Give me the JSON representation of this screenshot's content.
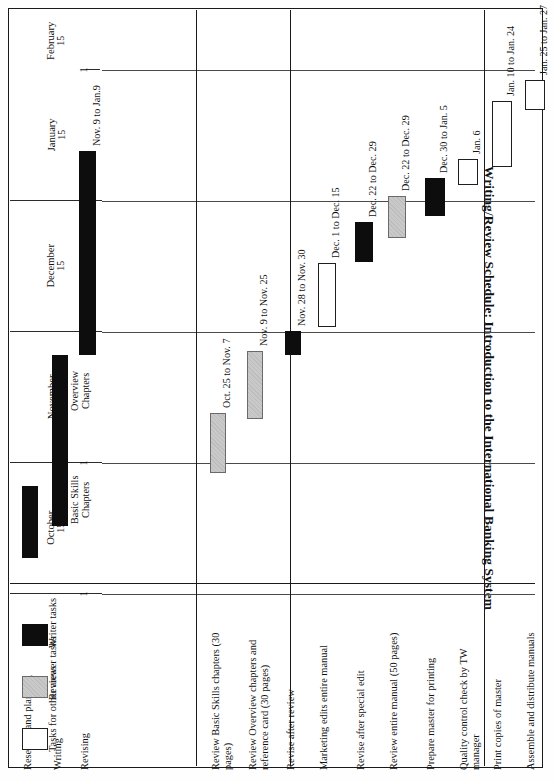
{
  "title": "Writing/Review Schedule: Introduction to the International Banking System",
  "legend": {
    "items": [
      {
        "key": "writer",
        "label": "Writer tasks",
        "color": "#0d0d0d"
      },
      {
        "key": "reviewer",
        "label": "Reviewer tasks",
        "color": "#c9c9c9"
      },
      {
        "key": "other",
        "label": "Tasks for other areas",
        "color": "#ffffff"
      }
    ]
  },
  "axis": {
    "orientation": "vertical-months",
    "months": [
      {
        "name": "October",
        "mid": "15",
        "start_tick": "1"
      },
      {
        "name": "November",
        "mid": "15",
        "start_tick": "1"
      },
      {
        "name": "December",
        "mid": "15",
        "start_tick": "1"
      },
      {
        "name": "January",
        "mid": "15",
        "start_tick": "1"
      },
      {
        "name": "February",
        "mid": "15",
        "start_tick": "1"
      }
    ]
  },
  "chart_data": {
    "type": "bar",
    "subtype": "gantt",
    "title": "Writing/Review Schedule: Introduction to the International Banking System",
    "xlabel": "",
    "ylabel": "",
    "grid": true,
    "legend_position": "bottom-left",
    "time_axis": {
      "labels": [
        "October 1",
        "October 15",
        "November 1",
        "November 15",
        "December 1",
        "December 15",
        "January 1",
        "January 15",
        "February 1",
        "February 15"
      ],
      "range": [
        "Oct 1",
        "Feb 28"
      ]
    },
    "categories": [
      "Research and planning",
      "Writing",
      "Revising",
      "Review Basic Skills chapters (30 pages)",
      "Review Overview chapters and reference card (30 pages)",
      "Revise after review",
      "Marketing edits entire manual",
      "Revise after special edit",
      "Review entire manual (50 pages)",
      "Prepare master for printing",
      "Quality control check by TW manager",
      "Print copies of master",
      "Assemble and distribute manuals"
    ],
    "groups": [
      {
        "name": "group-1",
        "tasks": [
          "Research and planning",
          "Writing",
          "Revising"
        ]
      },
      {
        "name": "group-2",
        "tasks": [
          "Review Basic Skills chapters (30 pages)",
          "Review Overview chapters and reference card (30 pages)",
          "Revise after review"
        ]
      },
      {
        "name": "group-3",
        "tasks": [
          "Marketing edits entire manual",
          "Revise after special edit",
          "Review entire manual (50 pages)"
        ]
      },
      {
        "name": "group-4",
        "tasks": [
          "Prepare master for printing",
          "Quality control check by TW manager",
          "Print copies of master",
          "Assemble and distribute manuals"
        ]
      }
    ],
    "bars": [
      {
        "task": "Research and planning",
        "type": "writer",
        "label": "",
        "start": "Oct. 1",
        "end": "Oct. 20"
      },
      {
        "task": "Writing",
        "type": "writer",
        "label": "Basic Skills Chapters",
        "start": "Oct. 14",
        "end": "Nov. 7",
        "inline": true
      },
      {
        "task": "Writing",
        "type": "writer",
        "label": "Overview Chapters",
        "start": "Nov. 8",
        "end": "Nov. 20",
        "inline": true
      },
      {
        "task": "Revising",
        "type": "writer",
        "label": "Nov. 9 to Jan.9",
        "start": "Nov. 9",
        "end": "Jan. 9"
      },
      {
        "task": "Review Basic Skills chapters (30 pages)",
        "type": "reviewer",
        "label": "Oct. 25 to Nov. 7",
        "start": "Oct. 25",
        "end": "Nov. 7"
      },
      {
        "task": "Review Overview chapters and reference card (30 pages)",
        "type": "reviewer",
        "label": "Nov. 9 to Nov. 25",
        "start": "Nov. 9",
        "end": "Nov. 25"
      },
      {
        "task": "Revise after review",
        "type": "writer",
        "label": "Nov. 28 to Nov. 30",
        "start": "Nov. 28",
        "end": "Nov. 30"
      },
      {
        "task": "Marketing edits entire manual",
        "type": "other",
        "label": "Dec. 1 to Dec. 15",
        "start": "Dec. 1",
        "end": "Dec. 15"
      },
      {
        "task": "Revise after special edit",
        "type": "writer",
        "label": "Dec. 22 to Dec. 29",
        "start": "Dec. 22",
        "end": "Dec. 29"
      },
      {
        "task": "Review entire manual (50 pages)",
        "type": "reviewer",
        "label": "Dec. 22 to Dec. 29",
        "start": "Dec. 22",
        "end": "Dec. 29"
      },
      {
        "task": "Prepare master for printing",
        "type": "writer",
        "label": "Dec. 30 to Jan. 5",
        "start": "Dec. 30",
        "end": "Jan. 5"
      },
      {
        "task": "Quality control check by TW manager",
        "type": "other",
        "label": "Jan. 6",
        "start": "Jan. 6",
        "end": "Jan. 6"
      },
      {
        "task": "Print copies of master",
        "type": "other",
        "label": "Jan. 10 to Jan. 24",
        "start": "Jan. 10",
        "end": "Jan. 24"
      },
      {
        "task": "Assemble and distribute manuals",
        "type": "other",
        "label": "Jan. 25 to Jan. 27",
        "start": "Jan. 25",
        "end": "Jan. 27"
      }
    ]
  },
  "layout": {
    "months_px": [
      {
        "name": "October",
        "top": 453,
        "height": 131
      },
      {
        "name": "November",
        "top": 322,
        "height": 131
      },
      {
        "name": "December",
        "top": 191,
        "height": 131
      },
      {
        "name": "January",
        "top": 60,
        "height": 131
      },
      {
        "name": "February",
        "top": 2,
        "height": 58
      }
    ],
    "group_sep_px": [
      94,
      188,
      382
    ],
    "tasks_px": [
      {
        "task": "Research and planning",
        "col": 22,
        "w": 16,
        "bars": [
          {
            "type": "writer",
            "top": 476,
            "h": 72,
            "lab": ""
          }
        ],
        "name_y": 770
      },
      {
        "task": "Writing",
        "col": 52,
        "w": 16,
        "bars": [
          {
            "type": "writer",
            "top": 400,
            "h": 116,
            "lab": "Basic Skills Chapters",
            "inline": true
          },
          {
            "type": "writer",
            "top": 345,
            "h": 58,
            "lab": "Overview Chapters",
            "inline": true
          }
        ],
        "name_y": 770
      },
      {
        "task": "Revising",
        "col": 79,
        "w": 17,
        "bars": [
          {
            "type": "writer",
            "top": 141,
            "h": 204,
            "lab": "Nov. 9 to Jan.9"
          }
        ],
        "name_y": 770
      },
      {
        "task": "Review Basic Skills chapters (30 pages)",
        "col": 210,
        "w": 16,
        "bars": [
          {
            "type": "reviewer",
            "top": 403,
            "h": 60,
            "lab": "Oct. 25 to Nov. 7"
          }
        ],
        "name_y": 770
      },
      {
        "task": "Review Overview chapters and reference card (30 pages)",
        "col": 247,
        "w": 16,
        "bars": [
          {
            "type": "reviewer",
            "top": 341,
            "h": 68,
            "lab": "Nov. 9 to Nov. 25"
          }
        ],
        "name_y": 770
      },
      {
        "task": "Revise after review",
        "col": 285,
        "w": 16,
        "bars": [
          {
            "type": "writer",
            "top": 321,
            "h": 24,
            "lab": "Nov. 28 to Nov. 30"
          }
        ],
        "name_y": 770
      },
      {
        "task": "Marketing edits entire manual",
        "col": 318,
        "w": 18,
        "bars": [
          {
            "type": "other",
            "top": 253,
            "h": 64,
            "lab": "Dec. 1 to Dec. 15"
          }
        ],
        "name_y": 770
      },
      {
        "task": "Revise after special edit",
        "col": 355,
        "w": 18,
        "bars": [
          {
            "type": "writer",
            "top": 212,
            "h": 40,
            "lab": "Dec. 22 to Dec. 29"
          }
        ],
        "name_y": 770
      },
      {
        "task": "Review entire manual (50 pages)",
        "col": 388,
        "w": 18,
        "bars": [
          {
            "type": "reviewer",
            "top": 186,
            "h": 42,
            "lab": "Dec. 22 to Dec. 29"
          }
        ],
        "name_y": 770
      },
      {
        "task": "Prepare master for printing",
        "col": 425,
        "w": 20,
        "bars": [
          {
            "type": "writer",
            "top": 168,
            "h": 38,
            "lab": "Dec. 30 to Jan. 5"
          }
        ],
        "name_y": 770
      },
      {
        "task": "Quality control check by TW manager",
        "col": 458,
        "w": 20,
        "bars": [
          {
            "type": "other",
            "top": 149,
            "h": 26,
            "lab": "Jan. 6"
          }
        ],
        "name_y": 770
      },
      {
        "task": "Print copies of master",
        "col": 492,
        "w": 20,
        "bars": [
          {
            "type": "other",
            "top": 91,
            "h": 66,
            "lab": "Jan. 10 to Jan. 24"
          }
        ],
        "name_y": 770
      },
      {
        "task": "Assemble and distribute manuals",
        "col": 525,
        "w": 20,
        "bars": [
          {
            "type": "other",
            "top": 70,
            "h": 30,
            "lab": "Jan. 25 to Jan. 27"
          }
        ],
        "name_y": 770
      }
    ]
  }
}
